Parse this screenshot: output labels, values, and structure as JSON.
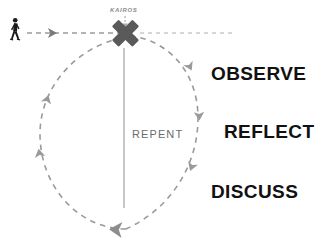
{
  "diagram": {
    "moment_label": "KAIROS",
    "center_label": "REPENT",
    "stages": [
      {
        "id": "observe",
        "label": "OBSERVE"
      },
      {
        "id": "reflect",
        "label": "REFLECT"
      },
      {
        "id": "discuss",
        "label": "DISCUSS"
      }
    ],
    "icons": {
      "walking_person": "walking-person-icon",
      "cross_mark": "x-cross-icon",
      "approach_arrow": "right-arrow-icon",
      "cycle_arrows": "cycle-arrow-icon"
    },
    "colors": {
      "background": "#ffffff",
      "cross": "#5a5a5a",
      "dashed_path": "#9a9a9a",
      "faded_path": "#cccccc",
      "stage_text": "#111111",
      "repent_text": "#6b6b6b",
      "kairos_text": "#8c8c8c",
      "person": "#1a1a1a"
    }
  }
}
